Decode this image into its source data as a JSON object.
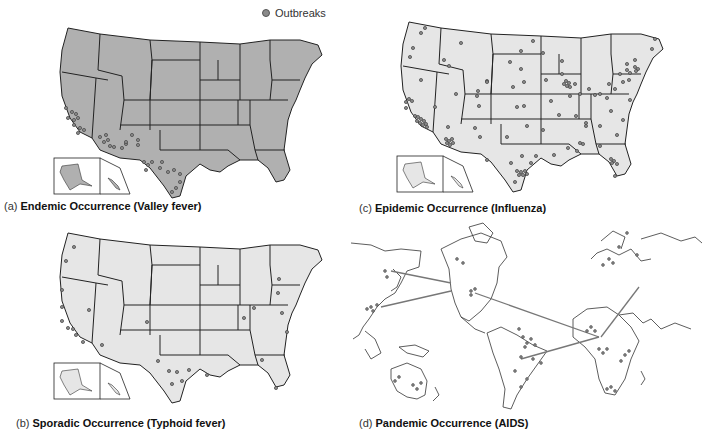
{
  "legend": {
    "icon": "outbreak-dot-icon",
    "label": "Outbreaks"
  },
  "colors": {
    "endemic_fill": "#b0b0b0",
    "light_fill": "#e6e6e6",
    "border": "#222222",
    "dot_fill": "#8a8a8a",
    "dot_stroke": "#444444",
    "world_line": "#777777"
  },
  "panels": [
    {
      "id": "a",
      "letter": "(a)",
      "title": "Endemic Occurrence (Valley fever)"
    },
    {
      "id": "b",
      "letter": "(b)",
      "title": "Sporadic Occurrence (Typhoid fever)"
    },
    {
      "id": "c",
      "letter": "(c)",
      "title": "Epidemic Occurrence (Influenza)"
    },
    {
      "id": "d",
      "letter": "(d)",
      "title": "Pandemic Occurrence (AIDS)"
    }
  ]
}
